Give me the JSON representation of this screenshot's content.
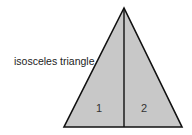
{
  "diagram": {
    "label": "isosceles triangle",
    "regions": [
      {
        "id": "1",
        "label": "1"
      },
      {
        "id": "2",
        "label": "2"
      }
    ],
    "colors": {
      "fill": "#c8c8c8",
      "stroke": "#111111",
      "background": "#ffffff"
    }
  }
}
